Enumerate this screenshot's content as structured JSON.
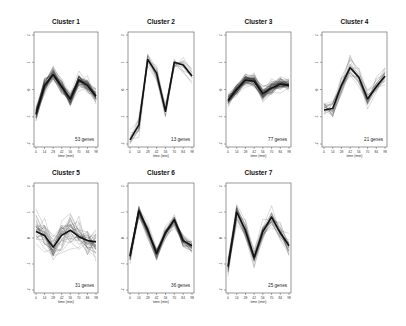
{
  "chart_data": {
    "type": "line",
    "layout": {
      "rows": 2,
      "cols": 4,
      "panels": 7,
      "grid": false,
      "legend": "none"
    },
    "x": [
      0,
      14,
      28,
      42,
      56,
      70,
      84,
      98
    ],
    "xlabel": "time (min)",
    "ylabel": "",
    "ylim": [
      -2,
      2
    ],
    "yticks": [
      -2,
      -1,
      0,
      1,
      2
    ],
    "panels": [
      {
        "title": "Cluster 1",
        "genes": 53,
        "note": "53 genes",
        "spread": 0.22,
        "centroid": [
          -0.9,
          0.15,
          0.55,
          0.1,
          -0.35,
          0.35,
          0.15,
          -0.25
        ]
      },
      {
        "title": "Cluster 2",
        "genes": 13,
        "note": "13 genes",
        "spread": 0.3,
        "centroid": [
          -1.85,
          -1.3,
          1.1,
          0.6,
          -0.8,
          1.0,
          0.9,
          0.5
        ]
      },
      {
        "title": "Cluster 3",
        "genes": 77,
        "note": "77 genes",
        "spread": 0.2,
        "centroid": [
          -0.4,
          0.0,
          0.35,
          0.3,
          -0.15,
          0.05,
          0.2,
          0.15
        ]
      },
      {
        "title": "Cluster 4",
        "genes": 21,
        "note": "21 genes",
        "spread": 0.33,
        "centroid": [
          -0.75,
          -0.7,
          0.15,
          0.8,
          0.45,
          -0.35,
          0.1,
          0.5
        ]
      },
      {
        "title": "Cluster 5",
        "genes": 31,
        "note": "31 genes",
        "spread": 0.55,
        "centroid": [
          0.25,
          0.1,
          -0.35,
          0.1,
          0.3,
          0.05,
          -0.1,
          -0.15
        ]
      },
      {
        "title": "Cluster 6",
        "genes": 36,
        "note": "36 genes",
        "spread": 0.2,
        "centroid": [
          -0.7,
          1.05,
          0.3,
          -0.6,
          0.2,
          0.7,
          -0.1,
          -0.3
        ]
      },
      {
        "title": "Cluster 7",
        "genes": 25,
        "note": "25 genes",
        "spread": 0.3,
        "centroid": [
          -1.1,
          1.0,
          0.3,
          -0.75,
          0.25,
          0.8,
          0.2,
          -0.3
        ]
      }
    ]
  }
}
